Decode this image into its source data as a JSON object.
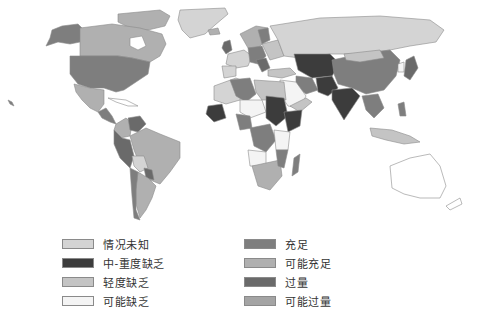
{
  "map": {
    "type": "choropleth-world-map",
    "colors": {
      "unknown": "#d4d4d4",
      "moderate_severe_deficiency": "#3c3c3c",
      "mild_deficiency": "#c4c4c4",
      "possible_deficiency": "#f4f4f4",
      "adequate": "#7e7e7e",
      "possibly_adequate": "#b0b0b0",
      "excessive": "#6a6a6a",
      "possibly_excessive": "#a4a4a4",
      "outline": "#8c8c8c"
    }
  },
  "legend": {
    "left": [
      {
        "label": "情况未知",
        "color": "#d4d4d4"
      },
      {
        "label": "中-重度缺乏",
        "color": "#3c3c3c"
      },
      {
        "label": "轻度缺乏",
        "color": "#c4c4c4"
      },
      {
        "label": "可能缺乏",
        "color": "#f4f4f4"
      }
    ],
    "right": [
      {
        "label": "充足",
        "color": "#7e7e7e"
      },
      {
        "label": "可能充足",
        "color": "#b0b0b0"
      },
      {
        "label": "过量",
        "color": "#6a6a6a"
      },
      {
        "label": "可能过量",
        "color": "#a4a4a4"
      }
    ]
  }
}
